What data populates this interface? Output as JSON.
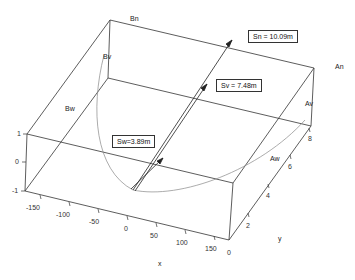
{
  "figure": {
    "type": "3d-box-diagram",
    "face_labels": {
      "Bn": "Bn",
      "Bv": "Bv",
      "Bw": "Bw",
      "An": "An",
      "Av": "Av",
      "Aw": "Aw"
    },
    "annotations": {
      "Sn": "Sn = 10.09m",
      "Sv": "Sv = 7.48m",
      "Sw": "Sw=3.89m"
    },
    "axes": {
      "x": {
        "label": "x",
        "ticks": [
          "-150",
          "-100",
          "-50",
          "0",
          "50",
          "100",
          "150"
        ]
      },
      "y": {
        "label": "y",
        "ticks": [
          "0",
          "2",
          "4",
          "6",
          "8"
        ]
      },
      "z": {
        "ticks": [
          "1",
          "0",
          "-1"
        ]
      }
    },
    "colors": {
      "line": "#333333",
      "curve": "#888888",
      "background": "#ffffff"
    }
  }
}
